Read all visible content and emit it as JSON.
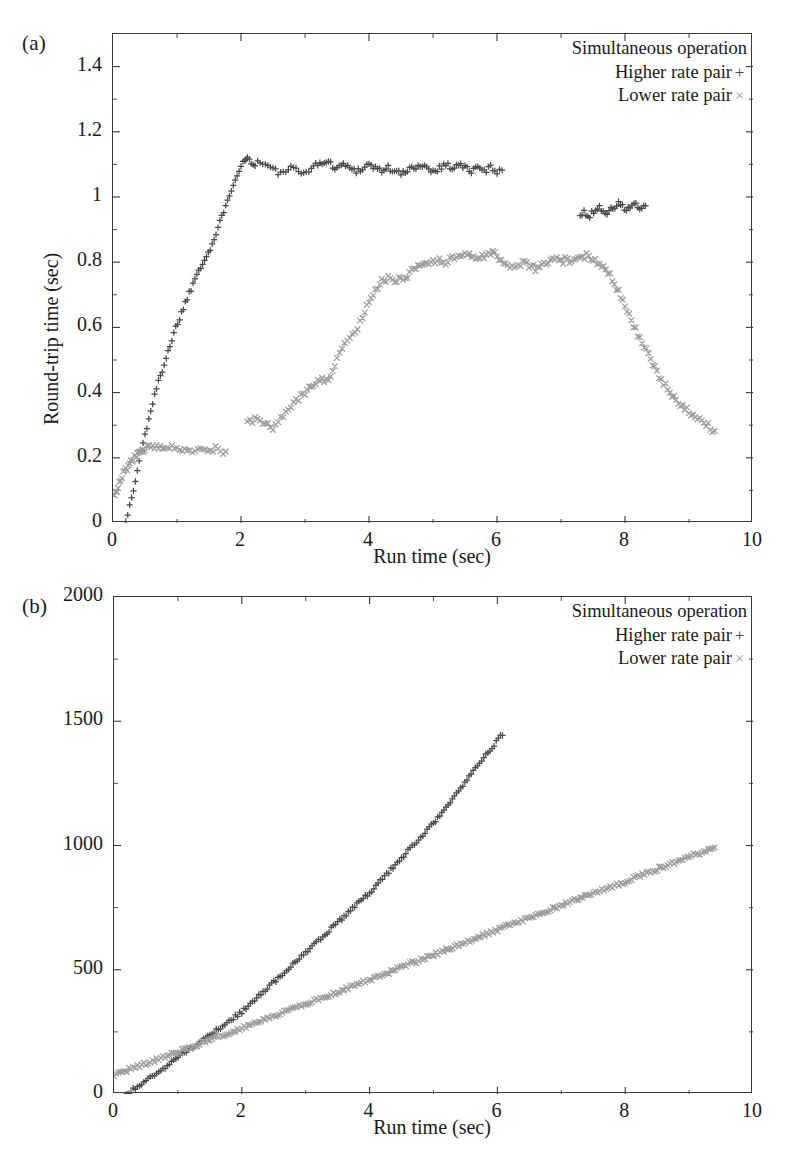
{
  "figure": {
    "panel_a_letter": "(a)",
    "panel_b_letter": "(b)"
  },
  "legend": {
    "title": "Simultaneous operation",
    "higher_label": "Higher rate pair",
    "higher_marker": "+",
    "lower_label": "Lower rate pair",
    "lower_marker": "×"
  },
  "colors": {
    "higher_rate": "#4a4a4a",
    "lower_rate": "#9e9e9e",
    "axis": "#3a3a3a",
    "text": "#1a1a1a",
    "background": "#ffffff"
  },
  "chart_data": [
    {
      "type": "scatter",
      "panel": "(a)",
      "title": "",
      "xlabel": "Run time (sec)",
      "ylabel": "Round-trip time (sec)",
      "xlim": [
        0,
        10
      ],
      "ylim": [
        0,
        1.5
      ],
      "xticks": [
        0,
        2,
        4,
        6,
        8,
        10
      ],
      "xticklabels": [
        "0",
        "2",
        "4",
        "6",
        "8",
        "10"
      ],
      "yticks": [
        0,
        0.2,
        0.4,
        0.6,
        0.8,
        1,
        1.2,
        1.4
      ],
      "yticklabels": [
        "0",
        "0.2",
        "0.4",
        "0.6",
        "0.8",
        "1",
        "1.2",
        "1.4"
      ],
      "grid": false,
      "legend_position": "top-right",
      "series": [
        {
          "name": "Higher rate pair",
          "marker": "+",
          "color": "#4a4a4a",
          "segments": [
            {
              "x": [
                0.2,
                0.26,
                0.32,
                0.38,
                0.44,
                0.5,
                0.56,
                0.62,
                0.68,
                0.74,
                0.8,
                0.86,
                0.92,
                0.98,
                1.04,
                1.1,
                1.16,
                1.22,
                1.28,
                1.34,
                1.4,
                1.46,
                1.52,
                1.58,
                1.64,
                1.7,
                1.76,
                1.82,
                1.88,
                1.94,
                2.0,
                2.06,
                2.1,
                2.16,
                2.22,
                2.3,
                2.38,
                2.46,
                2.54,
                2.62,
                2.7,
                2.78,
                2.86,
                2.94,
                3.02,
                3.1,
                3.2,
                3.3,
                3.4,
                3.5,
                3.6,
                3.7,
                3.8,
                3.9,
                4.0,
                4.1,
                4.2,
                4.3,
                4.4,
                4.5,
                4.6,
                4.7,
                4.8,
                4.9,
                5.0,
                5.1,
                5.2,
                5.3,
                5.4,
                5.5,
                5.6,
                5.7,
                5.8,
                5.9,
                6.0,
                6.08
              ],
              "y": [
                0.01,
                0.05,
                0.1,
                0.16,
                0.22,
                0.27,
                0.32,
                0.37,
                0.41,
                0.45,
                0.49,
                0.53,
                0.56,
                0.6,
                0.63,
                0.66,
                0.69,
                0.72,
                0.75,
                0.78,
                0.8,
                0.82,
                0.84,
                0.87,
                0.9,
                0.94,
                0.98,
                1.01,
                1.04,
                1.07,
                1.1,
                1.11,
                1.12,
                1.11,
                1.1,
                1.11,
                1.1,
                1.09,
                1.08,
                1.07,
                1.08,
                1.09,
                1.08,
                1.07,
                1.08,
                1.09,
                1.1,
                1.11,
                1.1,
                1.09,
                1.1,
                1.09,
                1.08,
                1.09,
                1.1,
                1.09,
                1.08,
                1.09,
                1.08,
                1.07,
                1.08,
                1.09,
                1.1,
                1.09,
                1.08,
                1.09,
                1.1,
                1.09,
                1.1,
                1.09,
                1.08,
                1.09,
                1.08,
                1.09,
                1.08,
                1.09
              ]
            },
            {
              "x": [
                7.3,
                7.36,
                7.42,
                7.48,
                7.54,
                7.6,
                7.66,
                7.72,
                7.78,
                7.84,
                7.9,
                7.96,
                8.02,
                8.08,
                8.14,
                8.2,
                8.26,
                8.32
              ],
              "y": [
                0.94,
                0.95,
                0.94,
                0.95,
                0.96,
                0.97,
                0.96,
                0.95,
                0.96,
                0.97,
                0.98,
                0.97,
                0.96,
                0.97,
                0.98,
                0.97,
                0.96,
                0.97
              ]
            }
          ]
        },
        {
          "name": "Lower rate pair",
          "marker": "×",
          "color": "#9e9e9e",
          "segments": [
            {
              "x": [
                0.02,
                0.06,
                0.1,
                0.14,
                0.18,
                0.22,
                0.26,
                0.3,
                0.34,
                0.38,
                0.42,
                0.46,
                0.5,
                0.56,
                0.62,
                0.68,
                0.74,
                0.8,
                0.88,
                0.96,
                1.04,
                1.12,
                1.2,
                1.28,
                1.36,
                1.44,
                1.52,
                1.6,
                1.68,
                1.76
              ],
              "y": [
                0.08,
                0.1,
                0.12,
                0.14,
                0.16,
                0.17,
                0.18,
                0.19,
                0.2,
                0.21,
                0.22,
                0.22,
                0.23,
                0.23,
                0.23,
                0.23,
                0.24,
                0.23,
                0.23,
                0.23,
                0.22,
                0.23,
                0.23,
                0.22,
                0.23,
                0.23,
                0.22,
                0.23,
                0.22,
                0.22
              ]
            },
            {
              "x": [
                2.1,
                2.18,
                2.26,
                2.34,
                2.42,
                2.5,
                2.58,
                2.66,
                2.74,
                2.82,
                2.9,
                3.0,
                3.1,
                3.2,
                3.3,
                3.4,
                3.5,
                3.58,
                3.66,
                3.74,
                3.82,
                3.9,
                4.0,
                4.1,
                4.2,
                4.3,
                4.4,
                4.5,
                4.6,
                4.7,
                4.8,
                4.9,
                5.0,
                5.1,
                5.2,
                5.3,
                5.4,
                5.5,
                5.6,
                5.7,
                5.8,
                5.9,
                6.0,
                6.1,
                6.2,
                6.3,
                6.4,
                6.5,
                6.6,
                6.7,
                6.8,
                6.9,
                7.0,
                7.1,
                7.2,
                7.3,
                7.4,
                7.5,
                7.6,
                7.7,
                7.8,
                7.9,
                8.0,
                8.1,
                8.2,
                8.3,
                8.4,
                8.5,
                8.6,
                8.7,
                8.8,
                8.9,
                9.0,
                9.1,
                9.2,
                9.3,
                9.4
              ],
              "y": [
                0.31,
                0.31,
                0.32,
                0.31,
                0.3,
                0.29,
                0.31,
                0.33,
                0.35,
                0.37,
                0.38,
                0.4,
                0.42,
                0.44,
                0.44,
                0.45,
                0.5,
                0.53,
                0.56,
                0.58,
                0.6,
                0.63,
                0.68,
                0.72,
                0.74,
                0.75,
                0.74,
                0.75,
                0.76,
                0.78,
                0.79,
                0.8,
                0.8,
                0.81,
                0.8,
                0.81,
                0.82,
                0.83,
                0.82,
                0.81,
                0.82,
                0.83,
                0.82,
                0.8,
                0.78,
                0.79,
                0.8,
                0.79,
                0.78,
                0.79,
                0.8,
                0.81,
                0.8,
                0.81,
                0.8,
                0.81,
                0.82,
                0.81,
                0.8,
                0.78,
                0.75,
                0.71,
                0.67,
                0.62,
                0.58,
                0.54,
                0.5,
                0.46,
                0.43,
                0.4,
                0.38,
                0.36,
                0.34,
                0.32,
                0.31,
                0.3,
                0.28
              ]
            }
          ]
        }
      ]
    },
    {
      "type": "scatter",
      "panel": "(b)",
      "title": "",
      "xlabel": "Run time (sec)",
      "ylabel": "Sequence numbers",
      "xlim": [
        0,
        10
      ],
      "ylim": [
        0,
        2000
      ],
      "xticks": [
        0,
        2,
        4,
        6,
        8,
        10
      ],
      "xticklabels": [
        "0",
        "2",
        "4",
        "6",
        "8",
        "10"
      ],
      "yticks": [
        0,
        500,
        1000,
        1500,
        2000
      ],
      "yticklabels": [
        "0",
        "500",
        "1000",
        "1500",
        "2000"
      ],
      "grid": false,
      "legend_position": "top-right",
      "series": [
        {
          "name": "Higher rate pair",
          "marker": "+",
          "color": "#4a4a4a",
          "segments": [
            {
              "x": [
                0.2,
                1.0,
                2.0,
                3.0,
                4.0,
                5.0,
                6.08
              ],
              "y": [
                0,
                145,
                330,
                570,
                810,
                1090,
                1450
              ]
            }
          ]
        },
        {
          "name": "Lower rate pair",
          "marker": "×",
          "color": "#9e9e9e",
          "segments": [
            {
              "x": [
                0.0,
                1.0,
                2.0,
                3.0,
                4.0,
                5.0,
                6.0,
                7.0,
                8.0,
                9.0,
                9.4
              ],
              "y": [
                78,
                168,
                265,
                360,
                460,
                560,
                660,
                760,
                855,
                955,
                990
              ]
            }
          ]
        }
      ]
    }
  ]
}
